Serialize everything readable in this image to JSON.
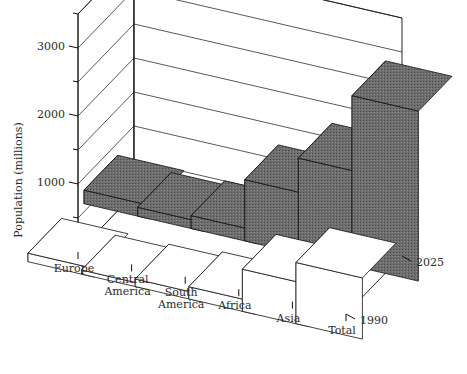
{
  "chart_data": {
    "type": "bar",
    "title": "",
    "subtitle": "",
    "xlabel": "",
    "ylabel": "Population (millions)",
    "zlabel": "",
    "categories": [
      "Europe",
      "Central America",
      "South America",
      "Africa",
      "Asia",
      "Total"
    ],
    "series": [
      {
        "name": "1990",
        "values": [
          125,
          60,
          110,
          180,
          620,
          900
        ]
      },
      {
        "name": "2025",
        "values": [
          200,
          130,
          190,
          900,
          1400,
          2500
        ]
      }
    ],
    "ytick_labels": [
      "0",
      "1000",
      "2000",
      "3000"
    ],
    "ytick_values": [
      0,
      1000,
      2000,
      3000
    ],
    "yminor_values": [
      500,
      1500,
      2500,
      3500
    ],
    "ylim": [
      0,
      3500
    ],
    "grid": true,
    "legend": "none",
    "projection": "3d",
    "series_colors": [
      "#ffffff",
      "#6e6e6e"
    ],
    "edge_color": "#111111",
    "background": "#ffffff"
  }
}
